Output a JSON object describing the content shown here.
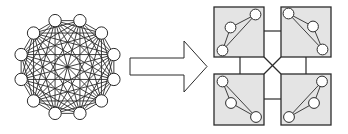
{
  "diagram": {
    "colors": {
      "background": "#ffffff",
      "stroke": "#2b2b2b",
      "node_fill": "#ffffff",
      "cluster_fill": "#e4e4e4",
      "arrow_fill": "#ffffff"
    },
    "complete_graph": {
      "node_count": 12,
      "center": [
        67.5,
        67
      ],
      "radius": 48,
      "start_angle_deg": 15,
      "node_radius": 6.2,
      "hub_radius": 1.6
    },
    "arrow": {
      "points": [
        [
          130,
          58
        ],
        [
          184,
          58
        ],
        [
          184,
          41
        ],
        [
          207,
          66.5
        ],
        [
          184,
          92
        ],
        [
          184,
          75
        ],
        [
          130,
          75
        ]
      ]
    },
    "clusters": [
      {
        "name": "cluster-top-left",
        "box": [
          214,
          7,
          50,
          50
        ],
        "nodes": [
          [
            255.5,
            14.5
          ],
          [
            230.5,
            27.5
          ],
          [
            222.5,
            50.5
          ]
        ]
      },
      {
        "name": "cluster-top-right",
        "box": [
          281,
          7,
          50,
          50
        ],
        "nodes": [
          [
            288.5,
            13.5
          ],
          [
            313,
            26.5
          ],
          [
            322.5,
            49.5
          ]
        ]
      },
      {
        "name": "cluster-bottom-left",
        "box": [
          214,
          74,
          50,
          51
        ],
        "nodes": [
          [
            222.5,
            81.5
          ],
          [
            231,
            103
          ],
          [
            256,
            117
          ]
        ]
      },
      {
        "name": "cluster-bottom-right",
        "box": [
          281,
          74,
          50,
          51
        ],
        "nodes": [
          [
            322,
            81.5
          ],
          [
            314,
            103
          ],
          [
            289,
            117
          ]
        ]
      }
    ],
    "cluster_node_radius": 5.4,
    "inter_cluster_links": [
      {
        "name": "link-top-horizontal",
        "from": [
          264,
          31
        ],
        "to": [
          281,
          31
        ]
      },
      {
        "name": "link-bottom-horizontal",
        "from": [
          264,
          99
        ],
        "to": [
          281,
          99
        ]
      },
      {
        "name": "link-left-vertical",
        "from": [
          240,
          57
        ],
        "to": [
          240,
          74
        ]
      },
      {
        "name": "link-right-vertical",
        "from": [
          306,
          57
        ],
        "to": [
          306,
          74
        ]
      },
      {
        "name": "link-diagonal-tl-br",
        "from": [
          264,
          57
        ],
        "to": [
          281,
          74
        ]
      },
      {
        "name": "link-diagonal-tr-bl",
        "from": [
          281,
          57
        ],
        "to": [
          264,
          74
        ]
      }
    ]
  }
}
